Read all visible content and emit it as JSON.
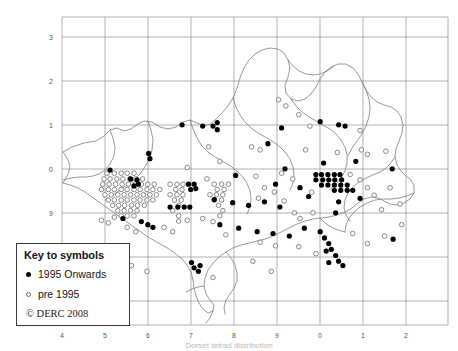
{
  "figure": {
    "kind": "species-distribution-map",
    "caption": "Dorset tetrad distribution"
  },
  "axes": {
    "x_ticks": [
      "4",
      "5",
      "6",
      "7",
      "8",
      "9",
      "0",
      "1",
      "2"
    ],
    "y_ticks": [
      "3",
      "2",
      "1",
      "0",
      "9",
      "8",
      "7"
    ],
    "grid": true,
    "frame_color": "#9a9a9a",
    "grid_color": "#8f8f8f"
  },
  "legend": {
    "title": "Key to symbols",
    "entries": [
      {
        "symbol": "filled-circle",
        "label": "1995 Onwards"
      },
      {
        "symbol": "open-circle",
        "label": "pre 1995"
      }
    ],
    "copyright": "© DERC 2008"
  },
  "colors": {
    "recent": "#000000",
    "historic": "#ffffff",
    "historic_stroke": "#6d6d6d",
    "coastline": "#7a7a7a",
    "boundary": "#8a8a8a"
  },
  "chart_data": {
    "type": "scatter",
    "title": "",
    "xlabel": "",
    "ylabel": "",
    "xlim": [
      3.5,
      12.5
    ],
    "ylim": [
      6.5,
      13.5
    ],
    "series": [
      {
        "name": "1995 Onwards",
        "marker": "filled-circle",
        "points": [
          [
            6.3,
            11.05
          ],
          [
            6.78,
            11.02
          ],
          [
            7.02,
            11.02
          ],
          [
            7.12,
            11.1
          ],
          [
            7.12,
            10.94
          ],
          [
            5.52,
            10.4
          ],
          [
            5.55,
            10.28
          ],
          [
            8.3,
            10.62
          ],
          [
            8.62,
            10.98
          ],
          [
            9.52,
            11.12
          ],
          [
            9.95,
            11.05
          ],
          [
            10.1,
            11.02
          ],
          [
            8.7,
            10.05
          ],
          [
            9.6,
            10.18
          ],
          [
            10.35,
            10.22
          ],
          [
            11.2,
            10.05
          ],
          [
            4.62,
            10.02
          ],
          [
            5.1,
            9.82
          ],
          [
            5.25,
            9.8
          ],
          [
            5.28,
            9.7
          ],
          [
            5.18,
            9.66
          ],
          [
            6.45,
            9.7
          ],
          [
            6.58,
            9.7
          ],
          [
            6.62,
            9.6
          ],
          [
            6.5,
            9.58
          ],
          [
            7.55,
            9.9
          ],
          [
            8.48,
            9.7
          ],
          [
            9.05,
            9.62
          ],
          [
            9.42,
            9.92
          ],
          [
            9.55,
            9.92
          ],
          [
            9.7,
            9.92
          ],
          [
            9.85,
            9.92
          ],
          [
            9.98,
            9.92
          ],
          [
            9.42,
            9.8
          ],
          [
            9.58,
            9.8
          ],
          [
            9.72,
            9.8
          ],
          [
            9.86,
            9.8
          ],
          [
            10.02,
            9.8
          ],
          [
            9.55,
            9.68
          ],
          [
            9.7,
            9.68
          ],
          [
            9.85,
            9.68
          ],
          [
            10.0,
            9.68
          ],
          [
            10.15,
            9.68
          ],
          [
            9.85,
            9.56
          ],
          [
            10.0,
            9.56
          ],
          [
            10.15,
            9.56
          ],
          [
            10.28,
            9.56
          ],
          [
            9.25,
            9.42
          ],
          [
            9.95,
            9.3
          ],
          [
            6.02,
            9.18
          ],
          [
            6.2,
            9.18
          ],
          [
            6.35,
            9.18
          ],
          [
            6.48,
            9.18
          ],
          [
            7.05,
            9.35
          ],
          [
            7.48,
            9.28
          ],
          [
            7.85,
            9.22
          ],
          [
            8.22,
            9.3
          ],
          [
            8.58,
            9.18
          ],
          [
            9.88,
            9.05
          ],
          [
            10.45,
            9.38
          ],
          [
            4.92,
            8.92
          ],
          [
            5.35,
            8.85
          ],
          [
            5.5,
            8.78
          ],
          [
            5.62,
            8.72
          ],
          [
            7.18,
            8.78
          ],
          [
            7.62,
            8.7
          ],
          [
            8.05,
            8.62
          ],
          [
            8.42,
            8.58
          ],
          [
            8.8,
            8.52
          ],
          [
            9.15,
            8.7
          ],
          [
            9.52,
            8.62
          ],
          [
            9.62,
            8.48
          ],
          [
            9.72,
            8.35
          ],
          [
            9.78,
            8.22
          ],
          [
            9.66,
            8.18
          ],
          [
            9.88,
            8.08
          ],
          [
            9.95,
            7.95
          ],
          [
            9.72,
            7.92
          ],
          [
            10.05,
            7.85
          ],
          [
            11.22,
            8.45
          ],
          [
            6.52,
            7.92
          ],
          [
            6.58,
            7.8
          ],
          [
            6.72,
            7.85
          ],
          [
            6.68,
            7.72
          ]
        ]
      },
      {
        "name": "pre 1995",
        "marker": "open-circle",
        "points": [
          [
            8.55,
            11.62
          ],
          [
            8.72,
            11.48
          ],
          [
            9.02,
            11.28
          ],
          [
            10.45,
            10.92
          ],
          [
            9.28,
            11.02
          ],
          [
            6.92,
            10.55
          ],
          [
            7.92,
            10.55
          ],
          [
            8.12,
            10.48
          ],
          [
            7.18,
            10.22
          ],
          [
            9.18,
            10.48
          ],
          [
            9.92,
            10.42
          ],
          [
            10.48,
            10.48
          ],
          [
            10.62,
            10.38
          ],
          [
            11.05,
            10.45
          ],
          [
            6.42,
            10.08
          ],
          [
            4.55,
            9.95
          ],
          [
            4.72,
            9.95
          ],
          [
            4.88,
            9.95
          ],
          [
            5.02,
            9.95
          ],
          [
            5.18,
            9.95
          ],
          [
            4.48,
            9.82
          ],
          [
            4.62,
            9.82
          ],
          [
            4.78,
            9.82
          ],
          [
            4.92,
            9.82
          ],
          [
            5.08,
            9.82
          ],
          [
            5.22,
            9.82
          ],
          [
            5.38,
            9.82
          ],
          [
            4.45,
            9.7
          ],
          [
            4.6,
            9.7
          ],
          [
            4.75,
            9.7
          ],
          [
            4.9,
            9.7
          ],
          [
            5.05,
            9.7
          ],
          [
            5.2,
            9.7
          ],
          [
            5.35,
            9.7
          ],
          [
            5.5,
            9.7
          ],
          [
            5.65,
            9.7
          ],
          [
            4.42,
            9.58
          ],
          [
            4.58,
            9.58
          ],
          [
            4.72,
            9.58
          ],
          [
            4.88,
            9.58
          ],
          [
            5.02,
            9.58
          ],
          [
            5.18,
            9.58
          ],
          [
            5.32,
            9.58
          ],
          [
            5.48,
            9.58
          ],
          [
            5.62,
            9.58
          ],
          [
            5.78,
            9.58
          ],
          [
            4.5,
            9.46
          ],
          [
            4.65,
            9.46
          ],
          [
            4.8,
            9.46
          ],
          [
            4.95,
            9.46
          ],
          [
            5.1,
            9.46
          ],
          [
            5.25,
            9.46
          ],
          [
            5.4,
            9.46
          ],
          [
            5.55,
            9.46
          ],
          [
            5.7,
            9.46
          ],
          [
            4.58,
            9.34
          ],
          [
            4.72,
            9.34
          ],
          [
            4.88,
            9.34
          ],
          [
            5.02,
            9.34
          ],
          [
            5.18,
            9.34
          ],
          [
            5.32,
            9.34
          ],
          [
            5.48,
            9.34
          ],
          [
            5.62,
            9.34
          ],
          [
            4.68,
            9.22
          ],
          [
            4.82,
            9.22
          ],
          [
            4.96,
            9.22
          ],
          [
            5.12,
            9.22
          ],
          [
            5.26,
            9.22
          ],
          [
            5.42,
            9.22
          ],
          [
            4.8,
            9.1
          ],
          [
            4.95,
            9.1
          ],
          [
            5.1,
            9.1
          ],
          [
            5.25,
            9.1
          ],
          [
            4.88,
            8.98
          ],
          [
            5.02,
            8.98
          ],
          [
            5.18,
            8.98
          ],
          [
            6.02,
            9.7
          ],
          [
            6.18,
            9.7
          ],
          [
            6.32,
            9.7
          ],
          [
            6.15,
            9.58
          ],
          [
            6.3,
            9.58
          ],
          [
            6.02,
            9.46
          ],
          [
            6.18,
            9.46
          ],
          [
            6.32,
            9.46
          ],
          [
            6.12,
            9.34
          ],
          [
            6.28,
            9.34
          ],
          [
            6.22,
            9.22
          ],
          [
            6.08,
            9.1
          ],
          [
            6.22,
            8.98
          ],
          [
            6.22,
            8.86
          ],
          [
            6.88,
            9.82
          ],
          [
            7.05,
            9.7
          ],
          [
            7.22,
            9.7
          ],
          [
            7.38,
            9.7
          ],
          [
            7.12,
            9.58
          ],
          [
            7.28,
            9.58
          ],
          [
            6.95,
            9.46
          ],
          [
            7.1,
            9.46
          ],
          [
            7.25,
            9.46
          ],
          [
            7.05,
            9.34
          ],
          [
            7.22,
            9.34
          ],
          [
            7.15,
            9.22
          ],
          [
            7.25,
            9.1
          ],
          [
            7.18,
            8.98
          ],
          [
            8.02,
            9.88
          ],
          [
            8.22,
            9.62
          ],
          [
            8.45,
            9.52
          ],
          [
            8.08,
            9.38
          ],
          [
            8.62,
            9.95
          ],
          [
            8.88,
            9.82
          ],
          [
            8.68,
            9.32
          ],
          [
            8.92,
            9.05
          ],
          [
            9.05,
            8.92
          ],
          [
            9.32,
            9.52
          ],
          [
            9.35,
            9.05
          ],
          [
            10.22,
            9.92
          ],
          [
            10.45,
            9.8
          ],
          [
            10.62,
            9.62
          ],
          [
            10.78,
            9.45
          ],
          [
            10.95,
            9.12
          ],
          [
            11.15,
            9.62
          ],
          [
            11.38,
            9.25
          ],
          [
            4.42,
            8.88
          ],
          [
            4.58,
            8.82
          ],
          [
            4.72,
            8.95
          ],
          [
            5.02,
            8.72
          ],
          [
            5.22,
            8.62
          ],
          [
            5.88,
            8.72
          ],
          [
            6.08,
            8.62
          ],
          [
            6.42,
            8.88
          ],
          [
            6.78,
            8.92
          ],
          [
            7.02,
            8.85
          ],
          [
            7.32,
            8.55
          ],
          [
            8.12,
            8.38
          ],
          [
            8.48,
            8.3
          ],
          [
            9.02,
            8.28
          ],
          [
            9.42,
            8.12
          ],
          [
            10.28,
            8.58
          ],
          [
            10.62,
            8.35
          ],
          [
            11.02,
            8.52
          ],
          [
            11.42,
            8.78
          ],
          [
            5.12,
            7.85
          ],
          [
            5.48,
            7.72
          ],
          [
            7.02,
            7.58
          ],
          [
            7.95,
            7.95
          ],
          [
            8.38,
            7.72
          ]
        ]
      }
    ]
  }
}
